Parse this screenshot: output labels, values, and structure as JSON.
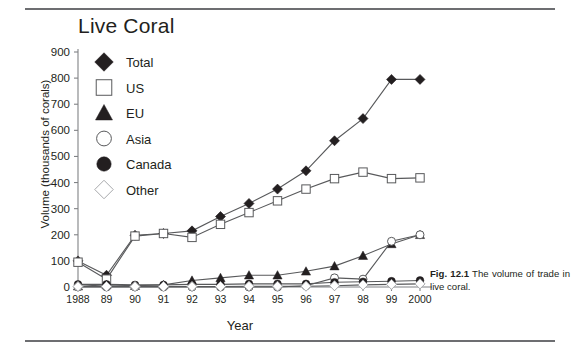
{
  "figure": {
    "title": "Live Coral",
    "caption_label": "Fig. 12.1",
    "caption_text": "The volume of trade in live coral."
  },
  "chart_data": {
    "type": "line",
    "title": "Live Coral",
    "xlabel": "Year",
    "ylabel": "Volume (thousands of corals)",
    "categories": [
      "1988",
      "89",
      "90",
      "91",
      "92",
      "93",
      "94",
      "95",
      "96",
      "97",
      "98",
      "99",
      "2000"
    ],
    "ylim": [
      0,
      900
    ],
    "yticks": [
      0,
      100,
      200,
      300,
      400,
      500,
      600,
      700,
      800,
      900
    ],
    "grid": false,
    "legend_position": "upper-left-inside",
    "series": [
      {
        "name": "Total",
        "marker": "filled-diamond",
        "values": [
          100,
          45,
          198,
          205,
          215,
          270,
          320,
          375,
          445,
          560,
          645,
          795,
          795
        ]
      },
      {
        "name": "US",
        "marker": "open-square",
        "values": [
          95,
          30,
          195,
          205,
          190,
          240,
          285,
          330,
          375,
          415,
          440,
          415,
          418
        ]
      },
      {
        "name": "EU",
        "marker": "filled-triangle",
        "values": [
          3,
          8,
          5,
          8,
          25,
          35,
          45,
          45,
          60,
          80,
          120,
          165,
          200
        ]
      },
      {
        "name": "Asia",
        "marker": "open-circle",
        "values": [
          0,
          0,
          0,
          0,
          0,
          0,
          0,
          0,
          5,
          35,
          30,
          175,
          200
        ]
      },
      {
        "name": "Canada",
        "marker": "filled-circle",
        "values": [
          10,
          10,
          8,
          8,
          10,
          10,
          12,
          12,
          12,
          18,
          20,
          22,
          25
        ]
      },
      {
        "name": "Other",
        "marker": "open-diamond",
        "values": [
          2,
          2,
          2,
          2,
          2,
          2,
          3,
          3,
          3,
          5,
          8,
          10,
          12
        ]
      }
    ]
  },
  "legend": [
    {
      "label": "Total",
      "marker": "filled-diamond"
    },
    {
      "label": "US",
      "marker": "open-square"
    },
    {
      "label": "EU",
      "marker": "filled-triangle"
    },
    {
      "label": "Asia",
      "marker": "open-circle"
    },
    {
      "label": "Canada",
      "marker": "filled-circle"
    },
    {
      "label": "Other",
      "marker": "open-diamond"
    }
  ],
  "colors": {
    "ink": "#231f20",
    "line": "#58595b",
    "axis": "#808285",
    "rule": "#6d6e71",
    "marker_fill_dark": "#231f20",
    "marker_fill_light": "#ffffff",
    "marker_stroke_light": "#a7a9ac"
  }
}
